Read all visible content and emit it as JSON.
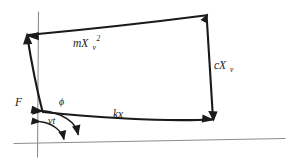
{
  "figure": {
    "kind": "hand-drawn-vector-diagram",
    "background_color": "#ffffff",
    "ink_color": "#1a1a1a",
    "axis_color": "#8d8d8d",
    "width": 292,
    "height": 162
  },
  "labels": {
    "top_vector": {
      "base": "mX",
      "sub": "v",
      "sup": "2",
      "text": "mXv2"
    },
    "right_vector": {
      "base": "cX",
      "sub": "v",
      "sup": "",
      "text": "cXv"
    },
    "bottom_vector": {
      "base": "kx",
      "sub": "",
      "sup": "",
      "text": "kx"
    },
    "left_vector": {
      "base": "F",
      "sub": "",
      "sup": "",
      "text": "F"
    },
    "angle_large": {
      "text": "ϕ"
    },
    "angle_small": {
      "base": "v",
      "sub": "",
      "sup": "",
      "text": "vt",
      "italic_t": "t"
    }
  },
  "geometry": {
    "origin": {
      "x": 38,
      "y": 142
    },
    "baseline": {
      "x1": 14,
      "y1": 143,
      "x2": 285,
      "y2": 138
    },
    "vertical_axis": {
      "x1": 38,
      "y1": 12,
      "x2": 38,
      "y2": 157
    },
    "polygon_vertices": [
      {
        "name": "bottom-left",
        "x": 42,
        "y": 111
      },
      {
        "name": "top-left",
        "x": 27,
        "y": 35
      },
      {
        "name": "top-right",
        "x": 207,
        "y": 15
      },
      {
        "name": "bottom-right",
        "x": 213,
        "y": 119
      }
    ],
    "arc_large": {
      "label": "ϕ",
      "start": {
        "x": 40,
        "y": 112
      },
      "end": {
        "x": 77,
        "y": 134
      }
    },
    "arc_small": {
      "label": "vt",
      "start": {
        "x": 41,
        "y": 122
      },
      "end": {
        "x": 64,
        "y": 139
      }
    }
  }
}
